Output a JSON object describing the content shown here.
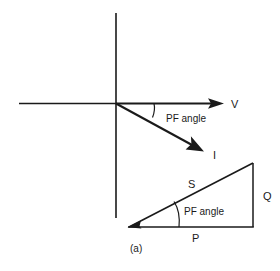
{
  "figure": {
    "caption": "(a)",
    "ink_color": "#1a1a1a",
    "background_color": "#ffffff",
    "phasor_diagram": {
      "name": "phasor-diagram",
      "axes": {
        "horizontal_label": "",
        "vertical_label": ""
      },
      "vectors": [
        {
          "id": "voltage",
          "label": "V",
          "direction_degrees": 0,
          "description": "voltage phasor along positive horizontal axis"
        },
        {
          "id": "current",
          "label": "I",
          "direction_degrees": -30,
          "description": "current phasor lagging voltage"
        }
      ],
      "angle_annotation": {
        "label": "PF angle",
        "between": [
          "V",
          "I"
        ]
      }
    },
    "power_triangle": {
      "name": "power-triangle",
      "sides": [
        {
          "id": "real-power",
          "label": "P",
          "position": "base"
        },
        {
          "id": "reactive-power",
          "label": "Q",
          "position": "vertical"
        },
        {
          "id": "apparent-power",
          "label": "S",
          "position": "hypotenuse"
        }
      ],
      "angle_annotation": {
        "label": "PF angle",
        "between": [
          "P",
          "S"
        ]
      }
    }
  }
}
